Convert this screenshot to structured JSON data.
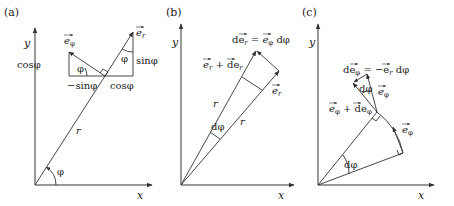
{
  "panels": {
    "a": {
      "label": "(a)",
      "x_axis": "x",
      "y_axis": "y",
      "e_r": "e",
      "e_r_sub": "r",
      "e_phi": "e",
      "e_phi_sub": "φ",
      "cos_left": "cosφ",
      "sin_right": "sinφ",
      "minus_sin": "−sinφ",
      "cos_bottom": "cosφ",
      "phi_small_left": "φ",
      "phi_small_right": "φ",
      "r": "r",
      "phi_angle": "φ"
    },
    "b": {
      "label": "(b)",
      "x_axis": "x",
      "y_axis": "y",
      "de_r_eq": "de",
      "de_r_sub": "r",
      "eq_rhs": " = ",
      "rhs_e": "e",
      "rhs_sub": "φ",
      "rhs_dphi": " dφ",
      "er_plus_der": "e",
      "er_plus_der_sub": "r",
      "plus_d": " + de",
      "plus_d_sub": "r",
      "e_r": "e",
      "e_r_sub": "r",
      "r_upper": "r",
      "r_lower": "r",
      "dphi": "dφ"
    },
    "c": {
      "label": "(c)",
      "x_axis": "x",
      "y_axis": "y",
      "de_phi": "de",
      "de_phi_sub": "φ",
      "eq_minus": " = −e",
      "eq_minus_sub": "r",
      "eq_dphi": " dφ",
      "dphi_triangle": "dφ",
      "e_phi_top": "e",
      "e_phi_top_sub": "φ",
      "ephi_plus": "e",
      "ephi_plus_sub": "φ",
      "plus_de": " + de",
      "plus_de_sub": "φ",
      "e_phi_right": "e",
      "e_phi_right_sub": "φ",
      "dphi_angle": "dφ"
    }
  }
}
